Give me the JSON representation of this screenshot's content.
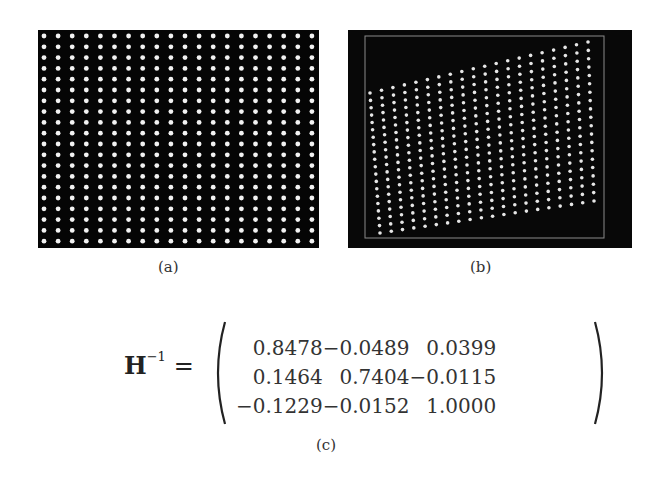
{
  "figure": {
    "panels": [
      {
        "id": "a",
        "caption": "(a)",
        "description": "Regular grid of white dots on black background",
        "grid": {
          "columns": 20,
          "rows": 20
        },
        "background_color": "#050505",
        "dot_color": "#f2f2f2"
      },
      {
        "id": "b",
        "caption": "(b)",
        "description": "Perspective-distorted grid of white dots inside a gray rectangular frame on black background",
        "grid": {
          "columns": 20,
          "rows": 20
        },
        "background_color": "#080808",
        "frame_color": "#8a8a8a",
        "dot_color": "#e6e6e6"
      }
    ],
    "equation": {
      "caption": "(c)",
      "lhs_symbol": "H",
      "lhs_superscript": "−1",
      "equals": "=",
      "matrix": [
        [
          "0.8478",
          "−0.0489",
          "0.0399"
        ],
        [
          "0.1464",
          "0.7404",
          "−0.0115"
        ],
        [
          "−0.1229",
          "−0.0152",
          "1.0000"
        ]
      ]
    }
  }
}
